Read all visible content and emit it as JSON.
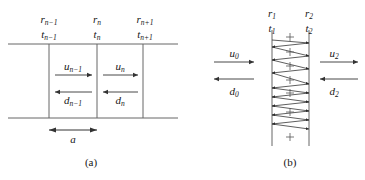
{
  "figure": {
    "type": "two-panel-physics-diagram",
    "background": "#ffffff",
    "ink": "#161616",
    "line_color": "#555555"
  },
  "panel_a": {
    "caption": "(a)",
    "interface_labels": [
      {
        "r": "r",
        "r_sub": "n−1",
        "t": "t",
        "t_sub": "n−1",
        "x": 49
      },
      {
        "r": "r",
        "r_sub": "n",
        "t": "t",
        "t_sub": "n",
        "x": 97
      },
      {
        "r": "r",
        "r_sub": "n+1",
        "t": "t",
        "t_sub": "n+1",
        "x": 143
      }
    ],
    "waves": [
      {
        "symbol": "u",
        "sub": "n−1",
        "direction": "right",
        "x": 73
      },
      {
        "symbol": "d",
        "sub": "n−1",
        "direction": "left",
        "x": 73
      },
      {
        "symbol": "u",
        "sub": "n",
        "direction": "right",
        "x": 120
      },
      {
        "symbol": "d",
        "sub": "n",
        "direction": "left",
        "x": 120
      }
    ],
    "dimension": {
      "symbol": "a",
      "from_x": 49,
      "to_x": 97
    },
    "layer_top_y": 44,
    "layer_bottom_y": 118
  },
  "panel_b": {
    "caption": "(b)",
    "interface_labels": [
      {
        "r": "r",
        "r_sub": "1",
        "t": "t",
        "t_sub": "1",
        "x": 90
      },
      {
        "r": "r",
        "r_sub": "2",
        "t": "t",
        "t_sub": "2",
        "x": 127
      }
    ],
    "external_waves": [
      {
        "symbol": "u",
        "sub": "0",
        "direction": "right",
        "side": "left",
        "label_x": 52,
        "label_y": 48
      },
      {
        "symbol": "d",
        "sub": "0",
        "direction": "left",
        "side": "left",
        "label_x": 52,
        "label_y": 86
      },
      {
        "symbol": "u",
        "sub": "2",
        "direction": "right",
        "side": "right",
        "label_x": 152,
        "label_y": 48
      },
      {
        "symbol": "d",
        "sub": "2",
        "direction": "left",
        "side": "right",
        "label_x": 152,
        "label_y": 86
      }
    ],
    "slab": {
      "left_x": 90,
      "right_x": 127,
      "top_y": 30,
      "bottom_y": 146
    },
    "internal_reflection_count": 11,
    "plus_marks": 7
  }
}
